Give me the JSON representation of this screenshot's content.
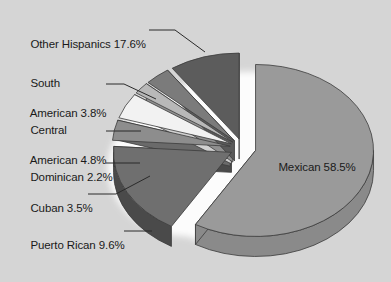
{
  "chart_data": {
    "type": "pie",
    "title": "",
    "subtitle": "",
    "xlabel": "",
    "ylabel": "",
    "legend_position": "none",
    "style": "3d-exploded",
    "categories": [
      "Mexican",
      "Other Hispanics",
      "South American",
      "Central American",
      "Dominican",
      "Cuban",
      "Puerto Rican"
    ],
    "values": [
      58.5,
      17.6,
      3.8,
      4.8,
      2.2,
      3.5,
      9.6
    ],
    "units": "percent",
    "slices": [
      {
        "name": "Mexican",
        "value": 58.5,
        "label": "Mexican 58.5%",
        "color": "#9a9a9a",
        "side_color": "#8a8a8a",
        "label_placement": "inside",
        "exploded": true
      },
      {
        "name": "Other Hispanics",
        "value": 17.6,
        "label": "Other Hispanics 17.6%",
        "color": "#6f6f6f",
        "side_color": "#4a4a4a",
        "label_placement": "outside-left",
        "exploded": true
      },
      {
        "name": "South American",
        "value": 3.8,
        "label_line1": "South",
        "label_line2": "American 3.8%",
        "label": "South American 3.8%",
        "color": "#8d8d8d",
        "side_color": "#6a6a6a",
        "label_placement": "outside-left",
        "exploded": true
      },
      {
        "name": "Central American",
        "value": 4.8,
        "label_line1": "Central",
        "label_line2": "American 4.8%",
        "label": "Central American 4.8%",
        "color": "#f2f2f2",
        "side_color": "#d0d0d0",
        "label_placement": "outside-left",
        "exploded": true
      },
      {
        "name": "Dominican",
        "value": 2.2,
        "label": "Dominican 2.2%",
        "color": "#b8b8b8",
        "side_color": "#909090",
        "label_placement": "outside-left",
        "exploded": true
      },
      {
        "name": "Cuban",
        "value": 3.5,
        "label": "Cuban 3.5%",
        "color": "#7b7b7b",
        "side_color": "#5a5a5a",
        "label_placement": "outside-left",
        "exploded": true
      },
      {
        "name": "Puerto Rican",
        "value": 9.6,
        "label": "Puerto Rican 9.6%",
        "color": "#5c5c5c",
        "side_color": "#3a3a3a",
        "label_placement": "outside-left",
        "exploded": true
      }
    ],
    "background_color": "#d5d5d5",
    "text_color": "#1a1a1a",
    "total": 100.0
  },
  "labels": {
    "other_hispanics": "Other Hispanics 17.6%",
    "south_american_l1": "South",
    "south_american_l2": "American 3.8%",
    "central_american_l1": "Central",
    "central_american_l2": "American 4.8%",
    "dominican": "Dominican 2.2%",
    "cuban": "Cuban 3.5%",
    "puerto_rican": "Puerto Rican 9.6%",
    "mexican": "Mexican 58.5%"
  }
}
